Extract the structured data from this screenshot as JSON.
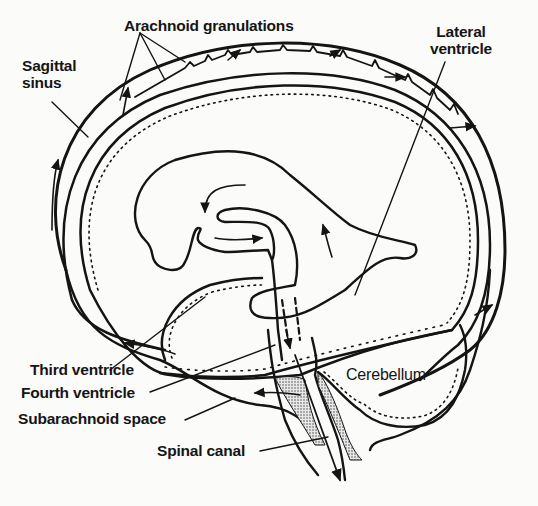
{
  "figure": {
    "colors": {
      "ink": "#141414",
      "background": "#fbfbfa",
      "stipple": "#8a8a8a"
    }
  },
  "labels": {
    "arachnoid_granulations": "Arachnoid granulations",
    "sagittal_sinus_line1": "Sagittal",
    "sagittal_sinus_line2": "sinus",
    "lateral_ventricle_line1": "Lateral",
    "lateral_ventricle_line2": "ventricle",
    "third_ventricle": "Third ventricle",
    "fourth_ventricle": "Fourth ventricle",
    "subarachnoid_space": "Subarachnoid space",
    "spinal_canal": "Spinal canal",
    "cerebellum": "Cerebellum"
  }
}
